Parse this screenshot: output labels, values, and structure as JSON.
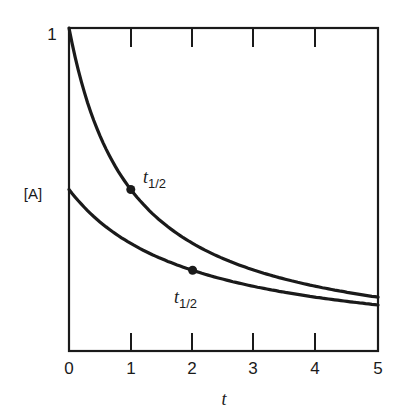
{
  "chart_data": {
    "type": "line",
    "title": "",
    "xlabel": "t",
    "ylabel": "[A]",
    "xlim": [
      0,
      5
    ],
    "ylim": [
      0,
      1
    ],
    "x_ticks": [
      "0",
      "1",
      "2",
      "3",
      "4",
      "5"
    ],
    "y_ticks": [
      "1"
    ],
    "grid": false,
    "legend": null,
    "series": [
      {
        "name": "[A]0 = 1",
        "x": [
          0,
          0.5,
          1,
          1.5,
          2,
          2.5,
          3,
          3.5,
          4,
          4.5,
          5
        ],
        "values": [
          1.0,
          0.667,
          0.5,
          0.4,
          0.333,
          0.286,
          0.25,
          0.222,
          0.2,
          0.182,
          0.167
        ],
        "marker": {
          "x": 1,
          "y": 0.5,
          "label": "t",
          "label_sub": "1/2"
        }
      },
      {
        "name": "[A]0 = 0.5",
        "x": [
          0,
          0.5,
          1,
          1.5,
          2,
          2.5,
          3,
          3.5,
          4,
          4.5,
          5
        ],
        "values": [
          0.5,
          0.4,
          0.333,
          0.286,
          0.25,
          0.222,
          0.2,
          0.182,
          0.167,
          0.154,
          0.143
        ],
        "marker": {
          "x": 2,
          "y": 0.25,
          "label": "t",
          "label_sub": "1/2"
        }
      }
    ],
    "annotations": [
      {
        "text": "t1/2",
        "x": 1,
        "y": 0.5
      },
      {
        "text": "t1/2",
        "x": 2,
        "y": 0.25
      }
    ],
    "line_color": "#1a1a1a"
  }
}
